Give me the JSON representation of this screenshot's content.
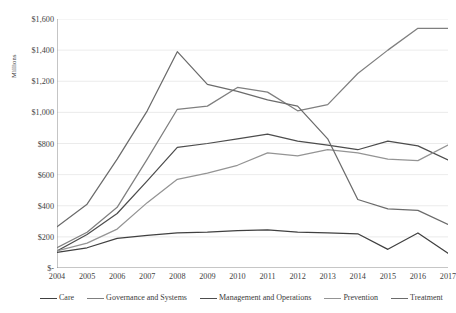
{
  "chart_data": {
    "type": "line",
    "title": "",
    "xlabel": "",
    "ylabel": "Millions",
    "categories": [
      2004,
      2005,
      2006,
      2007,
      2008,
      2009,
      2010,
      2011,
      2012,
      2013,
      2014,
      2015,
      2016,
      2017
    ],
    "x_tick_labels": [
      "2004",
      "2005",
      "2006",
      "2007",
      "2008",
      "2009",
      "2010",
      "2011",
      "2012",
      "2013",
      "2014",
      "2015",
      "2016",
      "2017"
    ],
    "y_tick_labels": [
      "$-",
      "$200",
      "$400",
      "$600",
      "$800",
      "$1,000",
      "$1,200",
      "$1,400",
      "$1,600"
    ],
    "y_tick_values": [
      0,
      200,
      400,
      600,
      800,
      1000,
      1200,
      1400,
      1600
    ],
    "ylim": [
      0,
      1600
    ],
    "grid": true,
    "legend_position": "bottom",
    "series": [
      {
        "name": "Care",
        "color": "#404040",
        "values": [
          100,
          130,
          190,
          210,
          225,
          230,
          240,
          245,
          230,
          225,
          220,
          120,
          225,
          95
        ]
      },
      {
        "name": "Governance and Systems",
        "color": "#7f7f7f",
        "values": [
          130,
          230,
          390,
          700,
          1020,
          1040,
          1160,
          1130,
          1010,
          1050,
          1250,
          1400,
          1540,
          1540
        ]
      },
      {
        "name": "Management and Operations",
        "color": "#4d4d4d",
        "values": [
          110,
          215,
          350,
          560,
          775,
          800,
          830,
          860,
          815,
          790,
          760,
          815,
          785,
          695
        ]
      },
      {
        "name": "Prevention",
        "color": "#949494",
        "values": [
          110,
          160,
          250,
          420,
          570,
          610,
          660,
          740,
          720,
          760,
          740,
          700,
          690,
          790
        ]
      },
      {
        "name": "Treatment",
        "color": "#6b6b6b",
        "values": [
          265,
          410,
          700,
          1010,
          1390,
          1180,
          1135,
          1080,
          1040,
          830,
          440,
          380,
          370,
          280
        ]
      }
    ]
  },
  "legend": {
    "items": [
      {
        "label": "Care",
        "color": "#404040"
      },
      {
        "label": "Governance and Systems",
        "color": "#7f7f7f"
      },
      {
        "label": "Management and Operations",
        "color": "#4d4d4d"
      },
      {
        "label": "Prevention",
        "color": "#949494"
      },
      {
        "label": "Treatment",
        "color": "#6b6b6b"
      }
    ]
  },
  "axes": {
    "y_title": "Millions",
    "grid_color": "#e3e3e3",
    "axis_color": "#808080"
  }
}
